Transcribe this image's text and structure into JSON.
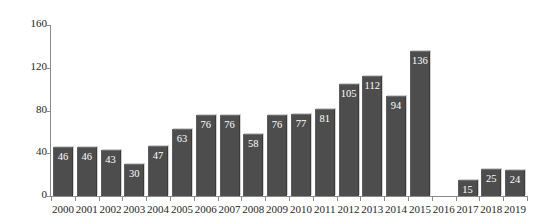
{
  "chart_data": {
    "type": "bar",
    "title": "",
    "subtitle": "",
    "xlabel": "",
    "ylabel": "",
    "categories": [
      "2000",
      "2001",
      "2002",
      "2003",
      "2004",
      "2005",
      "2006",
      "2007",
      "2008",
      "2009",
      "2010",
      "2011",
      "2012",
      "2013",
      "2014",
      "2015",
      "2016",
      "2017",
      "2018",
      "2019"
    ],
    "values": [
      46,
      46,
      43,
      30,
      47,
      63,
      76,
      76,
      58,
      76,
      77,
      81,
      105,
      112,
      94,
      136,
      null,
      15,
      25,
      24
    ],
    "value_labels": [
      "46",
      "46",
      "43",
      "30",
      "47",
      "63",
      "76",
      "76",
      "58",
      "76",
      "77",
      "81",
      "105",
      "112",
      "94",
      "136",
      "",
      "15",
      "25",
      "24"
    ],
    "ylim": [
      0,
      160
    ],
    "yticks": [
      0,
      40,
      80,
      120,
      160
    ],
    "ytick_labels": [
      "0",
      "40",
      "80",
      "120",
      "160"
    ],
    "grid": false,
    "legend": false,
    "legend_position": "none",
    "annotations": [
      "2016 has no bar shown"
    ],
    "colors": {
      "bar_fill": "#4d4d4d",
      "bar_highlight": "#6e6e6e",
      "bar_shadow": "#3a3a3a",
      "value_label": "#ffffff",
      "axis": "#8a8a8a",
      "tick_text": "#1f1f1f",
      "background": "#ffffff"
    }
  }
}
